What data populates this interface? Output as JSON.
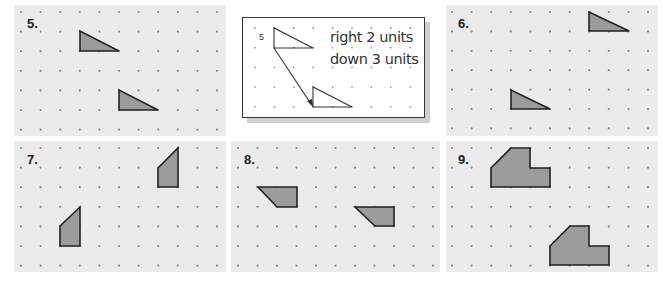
{
  "example": {
    "label": "5",
    "line1": "right 2 units",
    "line2": "down 3 units"
  },
  "problems": [
    {
      "number": "5.",
      "type": "triangle"
    },
    {
      "number": "6.",
      "type": "triangle"
    },
    {
      "number": "7.",
      "type": "quadrilateral"
    },
    {
      "number": "8.",
      "type": "trapezoid"
    },
    {
      "number": "9.",
      "type": "hexagon"
    }
  ],
  "colors": {
    "panel_bg": "#ebebeb",
    "dot": "#8a8a8a",
    "shape_fill": "#9b9b9b",
    "shape_stroke": "#222222"
  }
}
